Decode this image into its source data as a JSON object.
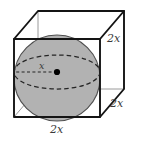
{
  "figure": {
    "colors": {
      "sphere_fill": "#b0b0b0",
      "sphere_outline": "#4a4a4a",
      "cube_edge": "#1a1a1a",
      "cube_edge_hidden": "#8a8a8a",
      "dashed_ellipse": "#2b2b2b",
      "center_dot": "#000000",
      "label_text": "#3a3a3a",
      "background": "#ffffff"
    },
    "labels": {
      "side_edge": "2x",
      "depth_edge": "2x",
      "bottom_edge": "2x",
      "radius": "x"
    },
    "geometry": {
      "cube_front_face": [
        [
          14,
          39
        ],
        [
          100,
          39
        ],
        [
          100,
          117
        ],
        [
          14,
          117
        ]
      ],
      "cube_back_face": [
        [
          38,
          11
        ],
        [
          124,
          11
        ],
        [
          124,
          89
        ],
        [
          38,
          89
        ]
      ],
      "sphere_center": [
        57,
        78
      ],
      "sphere_radius": 43,
      "equator_center": [
        57,
        72
      ],
      "equator_rx": 43,
      "equator_ry": 17,
      "center_dot": [
        57,
        72
      ],
      "radius_segment": [
        [
          57,
          72
        ],
        [
          14,
          72
        ]
      ]
    }
  }
}
